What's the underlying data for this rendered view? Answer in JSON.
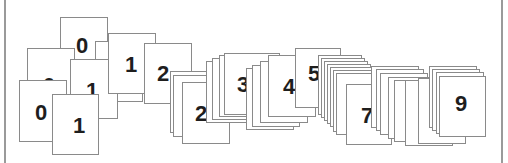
{
  "figure": {
    "colors": {
      "card_border": "#8a8a8a",
      "card_fill": "#ffffff",
      "digit": "#1e1e1e",
      "frame": "#9a9a9a"
    },
    "cards": [
      {
        "x": 60,
        "y": 17,
        "w": 48,
        "h": 62,
        "label": "0",
        "lx": 15,
        "ly": 17,
        "size": 22
      },
      {
        "x": 27,
        "y": 48,
        "w": 48,
        "h": 62,
        "label": "0",
        "lx": 15,
        "ly": 26,
        "size": 22
      },
      {
        "x": 19,
        "y": 80,
        "w": 48,
        "h": 62,
        "label": "0",
        "lx": 15,
        "ly": 21,
        "size": 22
      },
      {
        "x": 95,
        "y": 41,
        "w": 48,
        "h": 61,
        "label": "",
        "lx": 0,
        "ly": 0,
        "size": 22
      },
      {
        "x": 70,
        "y": 59,
        "w": 48,
        "h": 60,
        "label": "1",
        "lx": 15,
        "ly": 20,
        "size": 22
      },
      {
        "x": 52,
        "y": 94,
        "w": 47,
        "h": 61,
        "label": "1",
        "lx": 20,
        "ly": 20,
        "size": 22
      },
      {
        "x": 108,
        "y": 33,
        "w": 48,
        "h": 61,
        "label": "1",
        "lx": 16,
        "ly": 20,
        "size": 22
      },
      {
        "x": 144,
        "y": 43,
        "w": 48,
        "h": 61,
        "label": "2",
        "lx": 12,
        "ly": 19,
        "size": 22
      },
      {
        "x": 170,
        "y": 71,
        "w": 48,
        "h": 62,
        "label": "",
        "lx": 0,
        "ly": 0,
        "size": 22
      },
      {
        "x": 173,
        "y": 75,
        "w": 48,
        "h": 62,
        "label": "",
        "lx": 0,
        "ly": 0,
        "size": 22
      },
      {
        "x": 182,
        "y": 82,
        "w": 48,
        "h": 62,
        "label": "2",
        "lx": 12,
        "ly": 20,
        "size": 22
      },
      {
        "x": 206,
        "y": 61,
        "w": 48,
        "h": 62,
        "label": "",
        "lx": 0,
        "ly": 0,
        "size": 22
      },
      {
        "x": 212,
        "y": 58,
        "w": 48,
        "h": 62,
        "label": "",
        "lx": 0,
        "ly": 0,
        "size": 22
      },
      {
        "x": 219,
        "y": 55,
        "w": 48,
        "h": 62,
        "label": "",
        "lx": 0,
        "ly": 0,
        "size": 22
      },
      {
        "x": 224,
        "y": 53,
        "w": 56,
        "h": 62,
        "label": "3",
        "lx": 12,
        "ly": 20,
        "size": 22
      },
      {
        "x": 246,
        "y": 68,
        "w": 48,
        "h": 62,
        "label": "",
        "lx": 0,
        "ly": 0,
        "size": 22
      },
      {
        "x": 252,
        "y": 65,
        "w": 48,
        "h": 62,
        "label": "",
        "lx": 0,
        "ly": 0,
        "size": 22
      },
      {
        "x": 260,
        "y": 61,
        "w": 48,
        "h": 62,
        "label": "",
        "lx": 0,
        "ly": 0,
        "size": 22
      },
      {
        "x": 268,
        "y": 55,
        "w": 48,
        "h": 62,
        "label": "4",
        "lx": 14,
        "ly": 20,
        "size": 22
      },
      {
        "x": 295,
        "y": 48,
        "w": 46,
        "h": 60,
        "label": "5",
        "lx": 12,
        "ly": 14,
        "size": 22
      },
      {
        "x": 318,
        "y": 55,
        "w": 44,
        "h": 60,
        "label": "",
        "lx": 0,
        "ly": 0,
        "size": 22
      },
      {
        "x": 321,
        "y": 58,
        "w": 44,
        "h": 60,
        "label": "",
        "lx": 0,
        "ly": 0,
        "size": 22
      },
      {
        "x": 324,
        "y": 61,
        "w": 44,
        "h": 60,
        "label": "",
        "lx": 0,
        "ly": 0,
        "size": 22
      },
      {
        "x": 327,
        "y": 64,
        "w": 44,
        "h": 60,
        "label": "",
        "lx": 0,
        "ly": 0,
        "size": 22
      },
      {
        "x": 330,
        "y": 67,
        "w": 44,
        "h": 60,
        "label": "",
        "lx": 0,
        "ly": 0,
        "size": 22
      },
      {
        "x": 333,
        "y": 70,
        "w": 44,
        "h": 62,
        "label": "",
        "lx": 0,
        "ly": 0,
        "size": 22
      },
      {
        "x": 336,
        "y": 73,
        "w": 44,
        "h": 62,
        "label": "",
        "lx": 0,
        "ly": 0,
        "size": 22
      },
      {
        "x": 346,
        "y": 84,
        "w": 46,
        "h": 61,
        "label": "7",
        "lx": 14,
        "ly": 20,
        "size": 22
      },
      {
        "x": 371,
        "y": 66,
        "w": 48,
        "h": 62,
        "label": "",
        "lx": 0,
        "ly": 0,
        "size": 22
      },
      {
        "x": 376,
        "y": 69,
        "w": 48,
        "h": 62,
        "label": "",
        "lx": 0,
        "ly": 0,
        "size": 22
      },
      {
        "x": 380,
        "y": 73,
        "w": 48,
        "h": 62,
        "label": "",
        "lx": 0,
        "ly": 0,
        "size": 22
      },
      {
        "x": 388,
        "y": 77,
        "w": 48,
        "h": 62,
        "label": "",
        "lx": 0,
        "ly": 0,
        "size": 22
      },
      {
        "x": 394,
        "y": 80,
        "w": 48,
        "h": 62,
        "label": "",
        "lx": 0,
        "ly": 0,
        "size": 22
      },
      {
        "x": 405,
        "y": 80,
        "w": 48,
        "h": 66,
        "label": "",
        "lx": 0,
        "ly": 0,
        "size": 22
      },
      {
        "x": 418,
        "y": 78,
        "w": 48,
        "h": 66,
        "label": "",
        "lx": 0,
        "ly": 0,
        "size": 22
      },
      {
        "x": 429,
        "y": 66,
        "w": 48,
        "h": 62,
        "label": "",
        "lx": 0,
        "ly": 0,
        "size": 22
      },
      {
        "x": 432,
        "y": 69,
        "w": 48,
        "h": 62,
        "label": "",
        "lx": 0,
        "ly": 0,
        "size": 22
      },
      {
        "x": 436,
        "y": 72,
        "w": 48,
        "h": 62,
        "label": "",
        "lx": 0,
        "ly": 0,
        "size": 22
      },
      {
        "x": 439,
        "y": 76,
        "w": 47,
        "h": 61,
        "label": "9",
        "lx": 15,
        "ly": 16,
        "size": 22
      }
    ]
  }
}
